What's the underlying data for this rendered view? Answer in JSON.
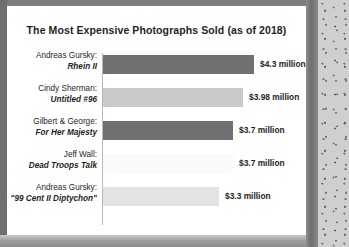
{
  "chart_data": {
    "type": "bar",
    "orientation": "horizontal",
    "title": "The Most Expensive Photographs Sold (as of 2018)",
    "xlabel": "",
    "ylabel": "",
    "xlim": [
      0,
      4.8
    ],
    "grid": false,
    "legend": null,
    "unit": "million USD",
    "categories": [
      "Andreas Gursky: Rhein II",
      "Cindy Sherman: Untitled #96",
      "Gilbert & George: For Her Majesty",
      "Jeff Wall: Dead Troops Talk",
      "Andreas Gursky: \"99 Cent II Diptychon\""
    ],
    "values": [
      4.3,
      3.98,
      3.7,
      3.7,
      3.3
    ],
    "value_labels": [
      "$4.3 million",
      "$3.98 million",
      "$3.7 million",
      "$3.7 million",
      "$3.3 million"
    ],
    "bar_colors": [
      "#6f7072",
      "#c9cacb",
      "#6f7072",
      "#fafafa",
      "#e2e3e4"
    ],
    "bars": [
      {
        "artist": "Andreas Gursky:",
        "work": "Rhein II",
        "value": 4.3,
        "label": "$4.3 million",
        "color": "#6f7072"
      },
      {
        "artist": "Cindy Sherman:",
        "work": "Untitled #96",
        "value": 3.98,
        "label": "$3.98 million",
        "color": "#c9cacb"
      },
      {
        "artist": "Gilbert & George:",
        "work": "For Her Majesty",
        "value": 3.7,
        "label": "$3.7 million",
        "color": "#6f7072"
      },
      {
        "artist": "Jeff Wall:",
        "work": "Dead Troops Talk",
        "value": 3.7,
        "label": "$3.7 million",
        "color": "#fafafa"
      },
      {
        "artist": "Andreas Gursky:",
        "work": "\"99 Cent II Diptychon\"",
        "value": 3.3,
        "label": "$3.3 million",
        "color": "#e2e3e4"
      }
    ]
  }
}
